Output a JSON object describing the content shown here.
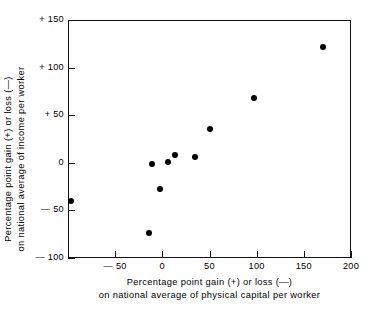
{
  "chart_data": {
    "type": "scatter",
    "title": "",
    "xlabel": "Percentage point gain (+) or loss (−) on national average of physical capital per worker",
    "ylabel": "Percentage point gain (+) or loss (−) on national average of income per worker",
    "xlabel_line1": "Percentage  point  gain  (+)  or  loss  (—)",
    "xlabel_line2": "on  national  average  of  physical  capital  per  worker",
    "ylabel_line1": "Percentage  point  gain  (+)  or  loss  (—)",
    "ylabel_line2": "on  national  average  of  income  per  worker",
    "xlim": [
      -100,
      200
    ],
    "ylim": [
      -100,
      150
    ],
    "grid": false,
    "legend": null,
    "xticks": [
      -50,
      0,
      50,
      100,
      150,
      200
    ],
    "xtick_labels": [
      "— 50",
      "0",
      "50",
      "100",
      "150",
      "200"
    ],
    "yticks": [
      -100,
      -50,
      0,
      50,
      100,
      150
    ],
    "ytick_labels": [
      "— 100",
      "— 50",
      "0",
      "+ 50",
      "+ 100",
      "+ 150"
    ],
    "marker_color": "#000000",
    "marker_shape": "circle",
    "points": [
      {
        "x": -97,
        "y": -40
      },
      {
        "x": -14,
        "y": -74
      },
      {
        "x": -11,
        "y": -1
      },
      {
        "x": -3,
        "y": -28
      },
      {
        "x": 6,
        "y": 1
      },
      {
        "x": 13,
        "y": 8
      },
      {
        "x": 35,
        "y": 6
      },
      {
        "x": 51,
        "y": 35
      },
      {
        "x": 97,
        "y": 68
      },
      {
        "x": 170,
        "y": 122
      }
    ]
  }
}
